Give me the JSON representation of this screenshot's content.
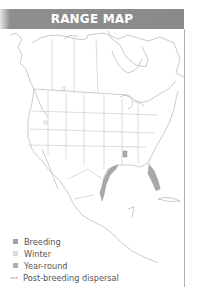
{
  "header": {
    "title": "RANGE MAP"
  },
  "map": {
    "region": "North and Central America",
    "colors": {
      "border": "#bdbdbd",
      "coast": "#9a9a9a",
      "range": "#a8a8a8"
    }
  },
  "legend": {
    "items": [
      {
        "label": "Breeding",
        "swatch": "square",
        "color": "#a0a0a0"
      },
      {
        "label": "Winter",
        "swatch": "square",
        "color": "#dcdcdc"
      },
      {
        "label": "Year-round",
        "swatch": "square",
        "color": "#b0b0b0"
      },
      {
        "label": "Post-breeding dispersal",
        "swatch": "dots",
        "color": "#c8a0a0"
      }
    ]
  }
}
